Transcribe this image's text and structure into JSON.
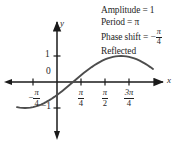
{
  "annotations": [
    {
      "id": "amplitude",
      "prefix": "Amplitude =",
      "value": "1"
    },
    {
      "id": "period",
      "prefix": "Period =",
      "value": "π"
    },
    {
      "id": "phase-shift",
      "prefix": "Phase shift = −",
      "value": "π/4"
    },
    {
      "id": "reflected",
      "prefix": "Reflected",
      "value": ""
    }
  ],
  "annotation_text": {
    "amplitude_label": "Amplitude = 1",
    "period_label": "Period = π",
    "phase_shift_label": "Phase shift = −",
    "phase_shift_num": "π",
    "phase_shift_den": "4",
    "reflected_label": "Reflected"
  },
  "axes": {
    "x_axis_label": "x",
    "y_axis_label": "y",
    "origin_label": "0",
    "y_tick_pos_label": "1",
    "y_tick_neg_label": "−1",
    "x_ticks": [
      {
        "label": "−π/4",
        "sign": "−",
        "num": "π",
        "den": "4",
        "value": -0.7853981634
      },
      {
        "label": "π/4",
        "sign": "",
        "num": "π",
        "den": "4",
        "value": 0.7853981634
      },
      {
        "label": "π/2",
        "sign": "",
        "num": "π",
        "den": "2",
        "value": 1.5707963268
      },
      {
        "label": "3π/4",
        "sign": "",
        "num": "3π",
        "den": "4",
        "value": 2.3561944902
      }
    ]
  },
  "colors": {
    "curve": "#4d4d4d",
    "axis": "#1a1a1a",
    "text": "#1f1f1f",
    "background": "#ffffff"
  },
  "chart_data": {
    "type": "line",
    "title": "",
    "xlabel": "x",
    "ylabel": "y",
    "function": "y = -sin(2(x + π/4))",
    "amplitude": 1,
    "period": 3.14159265,
    "phase_shift": -0.7853981634,
    "reflected": true,
    "xlim": [
      -1.30899694,
      3.14159265
    ],
    "ylim": [
      -1.6,
      1.6
    ],
    "grid": false,
    "legend": null,
    "x_tick_values": [
      -0.7853981634,
      0.7853981634,
      1.5707963268,
      2.3561944902
    ],
    "x_tick_labels": [
      "−π/4",
      "π/4",
      "π/2",
      "3π/4"
    ],
    "y_tick_values": [
      -1,
      0,
      1
    ],
    "y_tick_labels": [
      "−1",
      "0",
      "1"
    ],
    "key_points": [
      {
        "x": -0.7853981634,
        "y": -1.0,
        "note": "minimum at -π/4"
      },
      {
        "x": 0.0,
        "y": 0.0,
        "note": "zero crossing rising"
      },
      {
        "x": 0.7853981634,
        "y": 1.0,
        "note": "maximum at π/4"
      },
      {
        "x": 1.5707963268,
        "y": 0.0,
        "note": "zero crossing falling"
      },
      {
        "x": 2.3561944902,
        "y": -1.0,
        "note": "minimum at 3π/4"
      }
    ],
    "x": [
      -1.30899694,
      -1.22173048,
      -1.13446401,
      -1.04719755,
      -0.95993109,
      -0.87266463,
      -0.78539816,
      -0.6981317,
      -0.61086524,
      -0.52359878,
      -0.43633231,
      -0.34906585,
      -0.26179939,
      -0.17453293,
      -0.08726646,
      0.0,
      0.08726646,
      0.17453293,
      0.26179939,
      0.34906585,
      0.43633231,
      0.52359878,
      0.61086524,
      0.6981317,
      0.78539816,
      0.87266463,
      0.95993109,
      1.04719755,
      1.13446401,
      1.22173048,
      1.30899694,
      1.3962634,
      1.48352986,
      1.57079633,
      1.65806279,
      1.74532925,
      1.83259571,
      1.91986218,
      2.00712864,
      2.0943951,
      2.18166156,
      2.26892803,
      2.35619449,
      2.44346095,
      2.53072742,
      2.61799388,
      2.70526034,
      2.7925268,
      2.88179327,
      2.96705973,
      3.05432619,
      3.14159265
    ],
    "y": [
      -0.96592583,
      -0.98480775,
      -0.9961947,
      -1.0,
      -0.9961947,
      -0.98480775,
      -0.96592583,
      -0.93969262,
      -0.90630779,
      -0.8660254,
      -0.81915204,
      -0.76604444,
      -0.70710678,
      -0.64278761,
      -0.57357644,
      -0.5,
      -0.42261826,
      -0.34202014,
      -0.25881905,
      -0.17364818,
      -0.08715574,
      0.0,
      0.08715574,
      0.17364818,
      0.25881905,
      0.34202014,
      0.42261826,
      0.5,
      0.57357644,
      0.64278761,
      0.70710678,
      0.76604444,
      0.81915204,
      0.8660254,
      0.90630779,
      0.93969262,
      0.96592583,
      0.98480775,
      0.9961947,
      1.0,
      0.9961947,
      0.98480775,
      0.96592583,
      0.93969262,
      0.90630779,
      0.8660254,
      0.81915204,
      0.76604444,
      0.70710678,
      0.64278761,
      0.57357644,
      0.5
    ]
  }
}
